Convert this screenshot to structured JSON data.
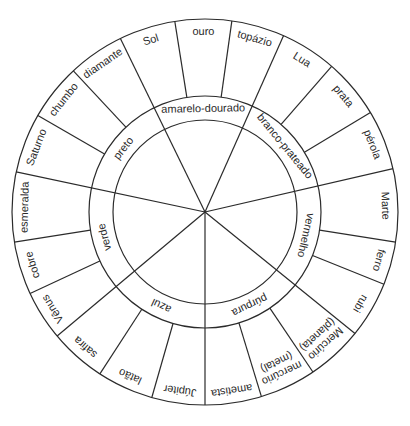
{
  "diagram": {
    "type": "correspondence-wheel",
    "geometry": {
      "cx": 205,
      "cy": 212,
      "outer_radius": 193,
      "ring_outer_radius": 116,
      "ring_inner_radius": 92
    },
    "colors": {
      "line": "#2b2b2b",
      "text": "#2a2a2a",
      "background": "#ffffff"
    },
    "inner_ring": [
      {
        "label": "preto",
        "start": 282,
        "end": 334
      },
      {
        "label": "amarelo-dourado",
        "start": 334,
        "end": 384
      },
      {
        "label": "branco-prateado",
        "start": 24,
        "end": 77
      },
      {
        "label": "vermelho",
        "start": 77,
        "end": 129
      },
      {
        "label": "púrpura",
        "start": 129,
        "end": 180
      },
      {
        "label": "azul",
        "start": 180,
        "end": 230
      },
      {
        "label": "verde",
        "start": 230,
        "end": 282
      }
    ],
    "outer_ring": [
      {
        "label": "Sol",
        "start": 334,
        "end": 351
      },
      {
        "label": "ouro",
        "start": 351,
        "end": 368
      },
      {
        "label": "topázio",
        "start": 8,
        "end": 24
      },
      {
        "label": "Lua",
        "start": 24,
        "end": 41
      },
      {
        "label": "prata",
        "start": 41,
        "end": 59
      },
      {
        "label": "pérola",
        "start": 59,
        "end": 77
      },
      {
        "label": "Marte",
        "start": 77,
        "end": 99
      },
      {
        "label": "ferro",
        "start": 99,
        "end": 112
      },
      {
        "label": "rubi",
        "start": 112,
        "end": 129
      },
      {
        "label": "Mercúrio (planeta)",
        "lines": [
          "Mercúrio",
          "(planeta)"
        ],
        "start": 129,
        "end": 146
      },
      {
        "label": "mercúrio (metal)",
        "lines": [
          "mercúrio",
          "(metal)"
        ],
        "start": 146,
        "end": 163
      },
      {
        "label": "ametista",
        "start": 163,
        "end": 180
      },
      {
        "label": "Júpiter",
        "start": 180,
        "end": 196
      },
      {
        "label": "latão",
        "start": 196,
        "end": 213
      },
      {
        "label": "safira",
        "start": 213,
        "end": 230
      },
      {
        "label": "Vênus",
        "start": 230,
        "end": 245
      },
      {
        "label": "cobre",
        "start": 245,
        "end": 261
      },
      {
        "label": "esmeralda",
        "start": 261,
        "end": 282
      },
      {
        "label": "Saturno",
        "start": 282,
        "end": 300
      },
      {
        "label": "chumbo",
        "start": 300,
        "end": 317
      },
      {
        "label": "diamante",
        "start": 317,
        "end": 334
      }
    ]
  }
}
